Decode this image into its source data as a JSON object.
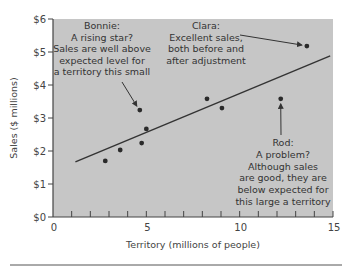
{
  "chart_data": {
    "type": "scatter",
    "title": "",
    "xlabel": "Territory (millions of people)",
    "ylabel": "Sales ($ millions)",
    "xlim": [
      0,
      15
    ],
    "ylim": [
      0,
      6
    ],
    "x_ticks": [
      0,
      5,
      10,
      15
    ],
    "x_tick_labels": [
      "0",
      "5",
      "10",
      "15"
    ],
    "x_minor_ticks": [
      1,
      2,
      3,
      4,
      5,
      6,
      7,
      8,
      9,
      10,
      11,
      12,
      13,
      14,
      15
    ],
    "y_ticks": [
      0,
      1,
      2,
      3,
      4,
      5,
      6
    ],
    "y_tick_labels": [
      "$0",
      "$1",
      "$2",
      "$3",
      "$4",
      "$5",
      "$6"
    ],
    "grid": false,
    "legend": null,
    "background_color": "#c6c6c6",
    "points": [
      {
        "x": 2.8,
        "y": 1.7
      },
      {
        "x": 3.6,
        "y": 2.03
      },
      {
        "x": 4.65,
        "y": 3.24,
        "label": "Bonnie"
      },
      {
        "x": 4.75,
        "y": 2.24
      },
      {
        "x": 5.0,
        "y": 2.67
      },
      {
        "x": 8.25,
        "y": 3.58
      },
      {
        "x": 9.05,
        "y": 3.3
      },
      {
        "x": 12.2,
        "y": 3.58,
        "label": "Rod"
      },
      {
        "x": 13.6,
        "y": 5.18,
        "label": "Clara"
      }
    ],
    "trend_line": {
      "x": [
        1.2,
        14.85
      ],
      "y": [
        1.67,
        4.88
      ]
    },
    "annotations": [
      {
        "target": "Bonnie",
        "lines": [
          "Bonnie:",
          "A rising star?",
          "Sales are well above",
          "expected level for",
          "a territory this small"
        ]
      },
      {
        "target": "Clara",
        "lines": [
          "Clara:",
          "Excellent sales,",
          "both before and",
          "after adjustment"
        ]
      },
      {
        "target": "Rod",
        "lines": [
          "Rod:",
          "A problem?",
          "Although sales",
          "are good, they are",
          "below expected for",
          "this large a territory"
        ]
      }
    ]
  }
}
